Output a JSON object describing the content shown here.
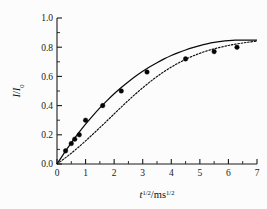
{
  "figure": {
    "background_color": "#fcfcfc",
    "foreground_color": "#0a0a0a"
  },
  "chart_data": {
    "type": "scatter",
    "title": "",
    "subtitle": "",
    "xlabel_plain": "t^1/2/ms^1/2",
    "xlabel_parts": {
      "variable": "t",
      "variable_exponent": "1/2",
      "separator": "/",
      "unit": "ms",
      "unit_exponent": "1/2"
    },
    "ylabel_plain": "I/I0",
    "ylabel_parts": {
      "numerator": "I",
      "separator": "/",
      "denominator": "I",
      "denominator_subscript": "0"
    },
    "xlim": [
      0,
      7
    ],
    "ylim": [
      0.0,
      1.0
    ],
    "xticks": [
      0,
      1,
      2,
      3,
      4,
      5,
      6,
      7
    ],
    "xticklabels": [
      "0",
      "1",
      "2",
      "3",
      "4",
      "5",
      "6",
      "7"
    ],
    "yticks": [
      0.0,
      0.2,
      0.4,
      0.6,
      0.8,
      1.0
    ],
    "yticklabels": [
      "0.0",
      "0.2",
      "0.4",
      "0.6",
      "0.8",
      "1.0"
    ],
    "x_minor_tick_step": 0.5,
    "y_minor_tick_step": 0.1,
    "tick_direction": "in",
    "grid": false,
    "legend": "none",
    "frame": "left-bottom-axes",
    "series": [
      {
        "name": "experimental-points",
        "style": "markers",
        "marker": "filled-circle",
        "marker_color": "#050505",
        "marker_size_px": 4.6,
        "x": [
          0.3,
          0.5,
          0.62,
          0.78,
          1.0,
          1.6,
          2.25,
          3.15,
          4.5,
          5.5,
          6.3
        ],
        "y": [
          0.09,
          0.14,
          0.17,
          0.2,
          0.3,
          0.4,
          0.5,
          0.63,
          0.72,
          0.77,
          0.8
        ]
      },
      {
        "name": "fit-solid",
        "style": "solid-line",
        "line_color": "#0a0a0a",
        "x": [
          0.0,
          0.25,
          0.5,
          0.75,
          1.0,
          1.25,
          1.5,
          1.75,
          2.0,
          2.25,
          2.5,
          2.75,
          3.0,
          3.25,
          3.5,
          3.75,
          4.0,
          4.25,
          4.5,
          4.75,
          5.0,
          5.25,
          5.5,
          5.75,
          6.0,
          6.25,
          6.5,
          6.75,
          7.0
        ],
        "y": [
          0.0,
          0.075,
          0.145,
          0.211,
          0.273,
          0.33,
          0.384,
          0.434,
          0.481,
          0.524,
          0.564,
          0.601,
          0.635,
          0.666,
          0.694,
          0.72,
          0.743,
          0.763,
          0.781,
          0.797,
          0.811,
          0.823,
          0.833,
          0.84,
          0.845,
          0.848,
          0.849,
          0.849,
          0.848
        ]
      },
      {
        "name": "fit-dotted",
        "style": "dotted-line",
        "line_color": "#0a0a0a",
        "x": [
          0.0,
          0.25,
          0.5,
          0.75,
          1.0,
          1.25,
          1.5,
          1.75,
          2.0,
          2.25,
          2.5,
          2.75,
          3.0,
          3.25,
          3.5,
          3.75,
          4.0,
          4.25,
          4.5,
          4.75,
          5.0,
          5.25,
          5.5,
          5.75,
          6.0,
          6.25,
          6.5,
          6.75,
          7.0
        ],
        "y": [
          0.0,
          0.036,
          0.074,
          0.115,
          0.158,
          0.203,
          0.249,
          0.296,
          0.343,
          0.39,
          0.436,
          0.48,
          0.522,
          0.562,
          0.599,
          0.633,
          0.664,
          0.692,
          0.717,
          0.739,
          0.758,
          0.775,
          0.789,
          0.801,
          0.812,
          0.821,
          0.829,
          0.836,
          0.842
        ]
      }
    ],
    "annotations": []
  }
}
